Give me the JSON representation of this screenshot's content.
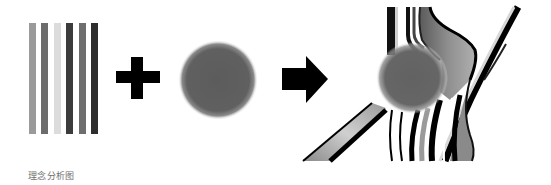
{
  "caption": "理念分析图",
  "diagram": {
    "elements": [
      {
        "name": "vertical-stripes",
        "label": "stripes",
        "count": 6
      },
      {
        "name": "plus-operator",
        "label": "+"
      },
      {
        "name": "blurred-circle",
        "label": "circle"
      },
      {
        "name": "arrow-operator",
        "label": "→"
      },
      {
        "name": "result-illustration",
        "label": "stripes bent around circle"
      }
    ],
    "stripes": [
      {
        "color": "#9a9a9a"
      },
      {
        "color": "#6c6c6c"
      },
      {
        "color": "#dcdcdc"
      },
      {
        "color": "#3c3c3c"
      },
      {
        "color": "#6e6e6e"
      },
      {
        "color": "#2e2e2e"
      }
    ],
    "colors": {
      "operator": "#000000",
      "circle": "#5f5f5f",
      "background": "#ffffff"
    }
  }
}
